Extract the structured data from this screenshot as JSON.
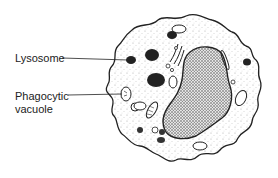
{
  "diagram": {
    "type": "biological-illustration",
    "labels": [
      {
        "id": "lysosome",
        "text": "Lysosome"
      },
      {
        "id": "phagocytic-vacuole",
        "line1": "Phagocytic",
        "line2": "vacuole"
      }
    ],
    "colors": {
      "ink": "#222222",
      "background": "#ffffff",
      "stipple": "#9a9a9a",
      "nucleus": "#3a3a3a"
    }
  }
}
